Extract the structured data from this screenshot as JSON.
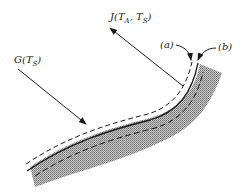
{
  "diagram": {
    "labels": {
      "incident": {
        "main": "G(T",
        "sub": "S",
        "close": ")"
      },
      "emitted": {
        "main": "J(T",
        "sub1": "A",
        "mid": ", T",
        "sub2": "S",
        "close": ")"
      },
      "surface_a": "(a)",
      "surface_b": "(b)"
    },
    "colors": {
      "ink": "#1a1a1a",
      "hatch": "#8a8a8a",
      "background": "#ffffff"
    }
  }
}
